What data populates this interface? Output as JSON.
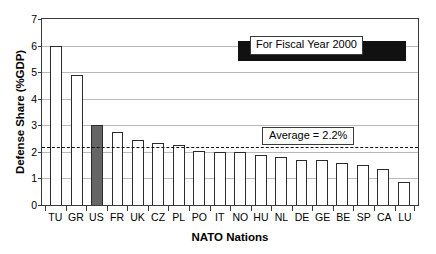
{
  "chart_data": {
    "type": "bar",
    "title": "",
    "xlabel": "NATO Nations",
    "ylabel": "Defense Share (%GDP)",
    "ylim": [
      0,
      7
    ],
    "ytick_labels": [
      "0",
      "1",
      "2",
      "3",
      "4",
      "5",
      "6",
      "7"
    ],
    "grid": true,
    "legend_position": "top-right",
    "categories": [
      "TU",
      "GR",
      "US",
      "FR",
      "UK",
      "CZ",
      "PL",
      "PO",
      "IT",
      "NO",
      "HU",
      "NL",
      "DE",
      "GE",
      "BE",
      "SP",
      "CA",
      "LU"
    ],
    "values": [
      6.0,
      4.9,
      3.0,
      2.75,
      2.45,
      2.35,
      2.25,
      2.05,
      2.0,
      2.0,
      1.9,
      1.8,
      1.7,
      1.7,
      1.6,
      1.5,
      1.35,
      0.85
    ],
    "highlighted_category": "US",
    "highlight_color": "#666666",
    "bar_color": "#ffffff",
    "bar_edge_color": "#2b2b2b",
    "annotations": [
      {
        "name": "average-line",
        "label": "Average = 2.2%",
        "value": 2.2,
        "style": "dashed"
      }
    ],
    "legend": [
      {
        "name": "fiscal-year-note",
        "label": "For Fiscal Year 2000",
        "swatch_color": "#111111"
      }
    ]
  }
}
